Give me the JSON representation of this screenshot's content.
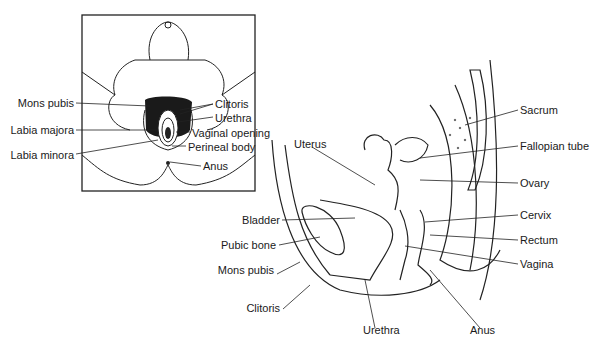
{
  "figure": {
    "inset": {
      "title": "External female genitalia (frontal view)",
      "labels_left": [
        "Mons pubis",
        "Labia majora",
        "Labia minora"
      ],
      "labels_right": [
        "Clitoris",
        "Urethra",
        "Vaginal opening",
        "Perineal body",
        "Anus"
      ]
    },
    "sagittal": {
      "labels_top": [
        "Uterus"
      ],
      "labels_left": [
        "Bladder",
        "Pubic bone",
        "Mons pubis",
        "Clitoris"
      ],
      "labels_right": [
        "Sacrum",
        "Fallopian tube",
        "Ovary",
        "Cervix",
        "Rectum",
        "Vagina"
      ],
      "labels_bottom": [
        "Urethra",
        "Anus"
      ]
    }
  }
}
